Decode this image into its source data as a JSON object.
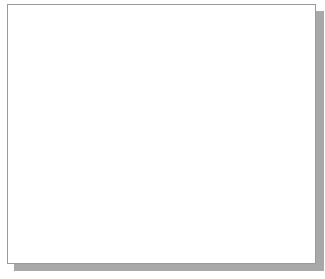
{
  "drawing": {
    "title": "Tangent circles with UCS icon",
    "grid": {
      "spacing": 15,
      "origin_x": 12,
      "origin_y": 7,
      "dot_color": "#bdbdbd"
    },
    "line_color": "#333333",
    "circles": [
      {
        "name": "large-circle",
        "cx": 149,
        "cy": 117,
        "r": 78
      },
      {
        "name": "top-right-circle",
        "cx": 255,
        "cy": 53,
        "r": 38
      },
      {
        "name": "bottom-left-circle",
        "cx": 74,
        "cy": 211,
        "r": 38
      }
    ],
    "tangent_lines": [
      {
        "name": "top-tangent-line",
        "x1": 137,
        "y1": 39,
        "x2": 251,
        "y2": 15
      },
      {
        "name": "left-tangent-line",
        "x1": 78,
        "y1": 88,
        "x2": 38,
        "y2": 195
      }
    ],
    "ucs_icon": {
      "y_label": "Y",
      "x_label": "X",
      "w_label": "W",
      "origin_x": 149,
      "origin_y": 118,
      "y_axis_length": 38,
      "x_axis_length": 35
    }
  }
}
